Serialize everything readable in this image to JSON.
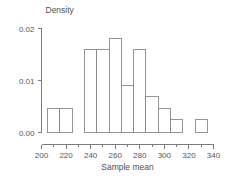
{
  "chart_data": {
    "type": "bar",
    "title": "",
    "subtitle": "",
    "xlabel": "Sample mean",
    "ylabel": "Density",
    "xlim": [
      200,
      340
    ],
    "ylim": [
      0,
      0.02
    ],
    "grid": false,
    "legend": null,
    "bin_width": 10,
    "x_major_ticks": [
      200,
      220,
      240,
      260,
      280,
      300,
      320,
      340
    ],
    "x_major_tick_labels": [
      "200",
      "220",
      "240",
      "260",
      "280",
      "300",
      "320",
      "340"
    ],
    "x_minor_ticks": [
      210,
      230,
      250,
      270,
      290,
      310,
      330
    ],
    "y_ticks": [
      0,
      0.01,
      0.02
    ],
    "y_tick_labels": [
      "0.00",
      "0.01",
      "0.02"
    ],
    "bins": [
      {
        "x0": 205,
        "x1": 215,
        "density": 0.0047
      },
      {
        "x0": 215,
        "x1": 225,
        "density": 0.0047
      },
      {
        "x0": 235,
        "x1": 245,
        "density": 0.016
      },
      {
        "x0": 245,
        "x1": 255,
        "density": 0.016
      },
      {
        "x0": 255,
        "x1": 265,
        "density": 0.018
      },
      {
        "x0": 265,
        "x1": 275,
        "density": 0.009
      },
      {
        "x0": 275,
        "x1": 285,
        "density": 0.016
      },
      {
        "x0": 285,
        "x1": 295,
        "density": 0.007
      },
      {
        "x0": 295,
        "x1": 305,
        "density": 0.0047
      },
      {
        "x0": 305,
        "x1": 315,
        "density": 0.0025
      },
      {
        "x0": 325,
        "x1": 335,
        "density": 0.0025
      }
    ],
    "colors": {
      "bar_fill": "#ffffff",
      "bar_stroke": "#8a8a8a",
      "axis": "#7d7d7d",
      "text": "#555555",
      "background": "#ffffff"
    }
  }
}
